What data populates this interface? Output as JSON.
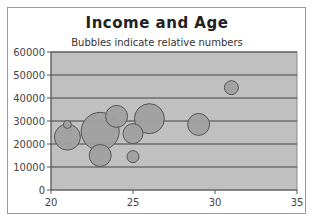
{
  "chart_data": {
    "type": "scatter",
    "subtype": "bubble",
    "title": "Income and Age",
    "subtitle": "Bubbles indicate relative numbers",
    "xlabel": "",
    "ylabel": "",
    "xlim": [
      20,
      35
    ],
    "ylim": [
      0,
      60000
    ],
    "x_ticks": [
      20,
      25,
      30,
      35
    ],
    "y_ticks": [
      0,
      10000,
      20000,
      30000,
      40000,
      50000,
      60000
    ],
    "grid": {
      "horizontal": true,
      "vertical": false
    },
    "legend": null,
    "series": [
      {
        "name": "Income vs Age",
        "points": [
          {
            "x": 21,
            "y": 23000,
            "size": 13
          },
          {
            "x": 21,
            "y": 28500,
            "size": 4
          },
          {
            "x": 23,
            "y": 25500,
            "size": 19
          },
          {
            "x": 24,
            "y": 32000,
            "size": 11
          },
          {
            "x": 23,
            "y": 15000,
            "size": 11
          },
          {
            "x": 25,
            "y": 24500,
            "size": 10
          },
          {
            "x": 26,
            "y": 31000,
            "size": 15
          },
          {
            "x": 25,
            "y": 14500,
            "size": 6
          },
          {
            "x": 29,
            "y": 28500,
            "size": 11
          },
          {
            "x": 31,
            "y": 44500,
            "size": 7
          }
        ]
      }
    ],
    "colors": {
      "plot_background": "#c0c0c0",
      "bubble_fill": "#a0a0a0",
      "bubble_stroke": "#555555",
      "gridline": "#444444"
    }
  }
}
